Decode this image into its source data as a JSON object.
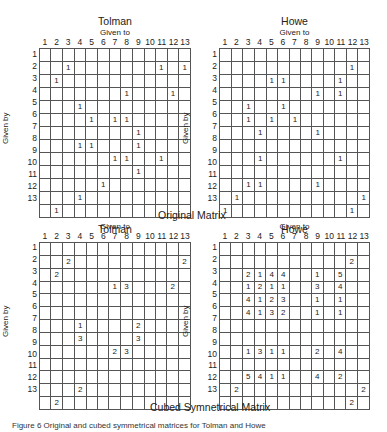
{
  "section_labels": {
    "original": "Original Matrix",
    "cubed": "Cubed Symnetrical Matrix"
  },
  "axis": {
    "given_to": "Given to",
    "given_by": "Given by"
  },
  "columns": [
    "1",
    "2",
    "3",
    "4",
    "5",
    "6",
    "7",
    "8",
    "9",
    "10",
    "11",
    "12",
    "13"
  ],
  "rows": [
    "1",
    "2",
    "3",
    "4",
    "5",
    "6",
    "7",
    "8",
    "9",
    "10",
    "11",
    "12",
    "13"
  ],
  "caption": "Figure 6 Original and cubed symmetrical matrices for Tolman and Howe",
  "matrices": [
    {
      "id": "tolman-original",
      "title": "Tolman",
      "cells": [
        [
          2,
          3,
          "1"
        ],
        [
          2,
          11,
          "1"
        ],
        [
          2,
          13,
          "1"
        ],
        [
          3,
          2,
          "1"
        ],
        [
          4,
          8,
          "1"
        ],
        [
          4,
          12,
          "1"
        ],
        [
          5,
          4,
          "1"
        ],
        [
          6,
          5,
          "1"
        ],
        [
          6,
          7,
          "1"
        ],
        [
          6,
          8,
          "1"
        ],
        [
          7,
          9,
          "1"
        ],
        [
          8,
          4,
          "1"
        ],
        [
          8,
          5,
          "1"
        ],
        [
          8,
          9,
          "1"
        ],
        [
          9,
          7,
          "1"
        ],
        [
          9,
          8,
          "1"
        ],
        [
          9,
          11,
          "1"
        ],
        [
          10,
          9,
          "1"
        ],
        [
          11,
          6,
          "1"
        ],
        [
          12,
          4,
          "1"
        ],
        [
          13,
          2,
          "1"
        ]
      ]
    },
    {
      "id": "howe-original",
      "title": "Howe",
      "cells": [
        [
          2,
          12,
          "1"
        ],
        [
          3,
          5,
          "1"
        ],
        [
          3,
          6,
          "1"
        ],
        [
          3,
          11,
          "1"
        ],
        [
          4,
          9,
          "1"
        ],
        [
          4,
          11,
          "1"
        ],
        [
          5,
          3,
          "1"
        ],
        [
          5,
          6,
          "1"
        ],
        [
          6,
          3,
          "1"
        ],
        [
          6,
          5,
          "1"
        ],
        [
          6,
          7,
          "1"
        ],
        [
          7,
          4,
          "1"
        ],
        [
          7,
          9,
          "1"
        ],
        [
          9,
          4,
          "1"
        ],
        [
          9,
          11,
          "1"
        ],
        [
          11,
          3,
          "1"
        ],
        [
          11,
          4,
          "1"
        ],
        [
          11,
          9,
          "1"
        ],
        [
          12,
          2,
          "1"
        ],
        [
          12,
          13,
          "1"
        ],
        [
          13,
          1,
          "1"
        ],
        [
          13,
          12,
          "1"
        ]
      ]
    },
    {
      "id": "tolman-cubed",
      "title": "Tolman",
      "cells": [
        [
          2,
          3,
          "2"
        ],
        [
          2,
          13,
          "2"
        ],
        [
          3,
          2,
          "2"
        ],
        [
          4,
          7,
          "1"
        ],
        [
          4,
          8,
          "3"
        ],
        [
          4,
          12,
          "2"
        ],
        [
          7,
          4,
          "1"
        ],
        [
          7,
          9,
          "2"
        ],
        [
          8,
          4,
          "3"
        ],
        [
          8,
          9,
          "3"
        ],
        [
          9,
          7,
          "2"
        ],
        [
          9,
          8,
          "3"
        ],
        [
          12,
          4,
          "2"
        ],
        [
          13,
          2,
          "2"
        ]
      ]
    },
    {
      "id": "howe-cubed",
      "title": "Howe",
      "cells": [
        [
          2,
          12,
          "2"
        ],
        [
          3,
          3,
          "2"
        ],
        [
          3,
          4,
          "1"
        ],
        [
          3,
          5,
          "4"
        ],
        [
          3,
          6,
          "4"
        ],
        [
          3,
          9,
          "1"
        ],
        [
          3,
          11,
          "5"
        ],
        [
          4,
          3,
          "1"
        ],
        [
          4,
          4,
          "2"
        ],
        [
          4,
          5,
          "1"
        ],
        [
          4,
          6,
          "1"
        ],
        [
          4,
          9,
          "3"
        ],
        [
          4,
          11,
          "4"
        ],
        [
          5,
          3,
          "4"
        ],
        [
          5,
          4,
          "1"
        ],
        [
          5,
          5,
          "2"
        ],
        [
          5,
          6,
          "3"
        ],
        [
          5,
          9,
          "1"
        ],
        [
          5,
          11,
          "1"
        ],
        [
          6,
          3,
          "4"
        ],
        [
          6,
          4,
          "1"
        ],
        [
          6,
          5,
          "3"
        ],
        [
          6,
          6,
          "2"
        ],
        [
          6,
          9,
          "1"
        ],
        [
          6,
          11,
          "1"
        ],
        [
          9,
          3,
          "1"
        ],
        [
          9,
          4,
          "3"
        ],
        [
          9,
          5,
          "1"
        ],
        [
          9,
          6,
          "1"
        ],
        [
          9,
          9,
          "2"
        ],
        [
          9,
          11,
          "4"
        ],
        [
          11,
          3,
          "5"
        ],
        [
          11,
          4,
          "4"
        ],
        [
          11,
          5,
          "1"
        ],
        [
          11,
          6,
          "1"
        ],
        [
          11,
          9,
          "4"
        ],
        [
          11,
          11,
          "2"
        ],
        [
          12,
          2,
          "2"
        ],
        [
          12,
          13,
          "2"
        ],
        [
          13,
          12,
          "2"
        ]
      ]
    }
  ]
}
